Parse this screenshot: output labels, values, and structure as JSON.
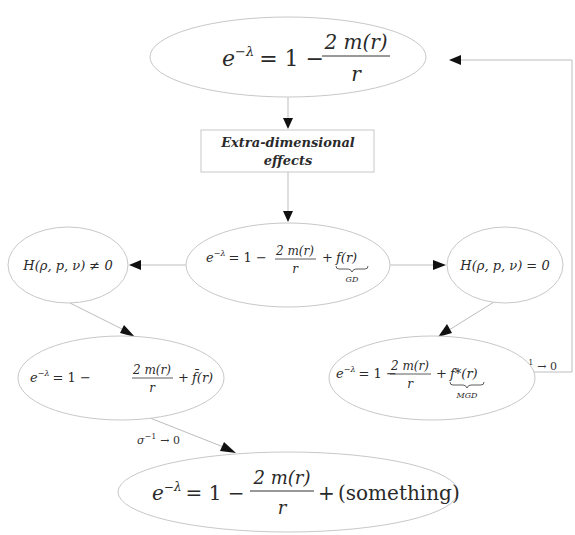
{
  "diagram": {
    "type": "flowchart",
    "nodes": [
      {
        "id": "schwarzschild",
        "shape": "ellipse",
        "lhs": "e",
        "lhs_sup": "−λ",
        "eq": "= 1 −",
        "frac_num": "2 m(r)",
        "frac_den": "r",
        "tail": "",
        "under": ""
      },
      {
        "id": "extra_dim",
        "shape": "box",
        "line1": "Extra-dimensional",
        "line2": "effects"
      },
      {
        "id": "gd",
        "shape": "ellipse",
        "lhs": "e",
        "lhs_sup": "−λ",
        "eq": "= 1 −",
        "frac_num": "2 m(r)",
        "frac_den": "r",
        "plus": "+",
        "tail": "f(r)",
        "under": "GD"
      },
      {
        "id": "h_nonzero",
        "shape": "ellipse",
        "text": "H(ρ, p, ν) ≠ 0"
      },
      {
        "id": "h_zero",
        "shape": "ellipse",
        "text": "H(ρ, p, ν) = 0"
      },
      {
        "id": "fbar",
        "shape": "ellipse",
        "lhs": "e",
        "lhs_sup": "−λ",
        "eq": "= 1 −",
        "frac_num": "2 m(r)",
        "frac_den": "r",
        "plus": "+",
        "tail": "f̄(r)",
        "under": ""
      },
      {
        "id": "mgd",
        "shape": "ellipse",
        "lhs": "e",
        "lhs_sup": "−λ",
        "eq": "= 1 −",
        "frac_num": "2 m(r)",
        "frac_den": "r",
        "plus": "+",
        "tail": "f*(r)",
        "under": "MGD"
      },
      {
        "id": "something",
        "shape": "ellipse",
        "lhs": "e",
        "lhs_sup": "−λ",
        "eq": "= 1 −",
        "frac_num": "2 m(r)",
        "frac_den": "r",
        "plus": "+",
        "tail": "(something)",
        "under": ""
      }
    ],
    "edges": [
      {
        "from": "schwarzschild",
        "to": "extra_dim",
        "label": ""
      },
      {
        "from": "extra_dim",
        "to": "gd",
        "label": ""
      },
      {
        "from": "gd",
        "to": "h_nonzero",
        "label": ""
      },
      {
        "from": "gd",
        "to": "h_zero",
        "label": ""
      },
      {
        "from": "h_nonzero",
        "to": "fbar",
        "label": ""
      },
      {
        "from": "h_zero",
        "to": "mgd",
        "label": ""
      },
      {
        "from": "fbar",
        "to": "something",
        "label": "σ⁻¹ → 0"
      },
      {
        "from": "mgd",
        "to": "schwarzschild",
        "label": "σ⁻¹ → 0"
      }
    ],
    "edge_labels": {
      "sigma_left": {
        "base": "σ",
        "sup": "−1",
        "rest": "→ 0"
      },
      "sigma_right": {
        "base": "σ",
        "sup": "−1",
        "rest": "→ 0"
      }
    }
  }
}
